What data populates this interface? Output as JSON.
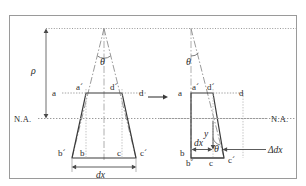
{
  "figure": {
    "title": "",
    "frame": {
      "border_color": "#9a9a9a",
      "background": "#ffffff"
    },
    "transition_arrow": "→",
    "colors": {
      "solid_line": "#3a3a3a",
      "dash_line": "#8a8a8a",
      "dotted_line": "#9a9a9a",
      "text": "#2b2b2b",
      "frame": "#9a9a9a"
    },
    "left_element": {
      "name": "undeformed-beam-element",
      "radius_label": "ρ",
      "angle_label": "θ",
      "neutral_axis_label": "N.A.",
      "corner_labels": {
        "top_left_outer": "a",
        "top_left_inner": "a´",
        "top_right_inner": "d´",
        "top_right_outer": "d",
        "bottom_left_outer": "b´",
        "bottom_left_inner": "b",
        "bottom_right_inner": "c",
        "bottom_right_outer": "c´"
      },
      "width_label": "dx"
    },
    "right_element": {
      "name": "deformed-beam-element",
      "angle_label": "θ",
      "neutral_axis_label": "N.A.",
      "corner_labels": {
        "top_left_outer": "a",
        "top_left_inner": "a´",
        "top_right_inner": "d´",
        "top_right_outer": "d",
        "bottom_left_inner": "b",
        "bottom_left_outer": "b´",
        "bottom_mid": "c",
        "bottom_right": "c´"
      },
      "width_label": "dx",
      "depth_label": "y",
      "elongation_label": "Δdx"
    }
  }
}
